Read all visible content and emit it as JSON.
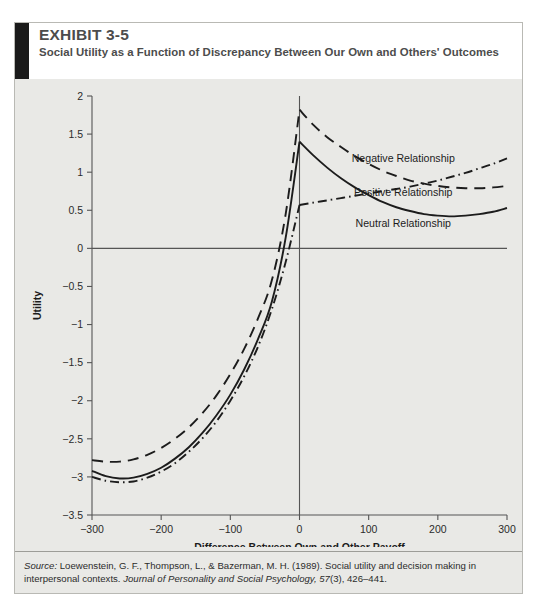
{
  "exhibit": {
    "number": "EXHIBIT 3-5",
    "title": "Social Utility as a Function of Discrepancy Between Our Own and Others' Outcomes"
  },
  "source": {
    "label": "Source:",
    "text_part1": " Loewenstein, G. F., Thompson, L., & Bazerman, M. H. (1989). Social utility and decision making in interpersonal contexts. ",
    "journal": "Journal of Personality and Social Psychology, 57",
    "text_part2": "(3), 426–441."
  },
  "chart_data": {
    "type": "line",
    "title": "Social Utility as a Function of Discrepancy Between Our Own and Others' Outcomes",
    "xlabel": "Difference Between Own and Other Payoff",
    "ylabel": "Utility",
    "xlim": [
      -300,
      300
    ],
    "ylim": [
      -3.5,
      2
    ],
    "xticks": [
      -300,
      -200,
      -100,
      0,
      100,
      200,
      300
    ],
    "xticklabels": [
      "−300",
      "−200",
      "−100",
      "0",
      "100",
      "200",
      "300"
    ],
    "yticks": [
      2,
      1.5,
      1,
      0.5,
      0,
      -0.5,
      -1,
      -1.5,
      -2,
      -2.5,
      -3,
      -3.5
    ],
    "yticklabels": [
      "2",
      "1.5",
      "1",
      "0.5",
      "0",
      "−0.5",
      "−1",
      "−1.5",
      "−2",
      "−2.5",
      "−3",
      "−3.5"
    ],
    "grid": false,
    "zero_line": true,
    "legend_position": "inline-right",
    "series": [
      {
        "name": "Negative Relationship",
        "style": "dashed",
        "label_x": 150,
        "label_y": 1.18,
        "x": [
          -300,
          -280,
          -260,
          -240,
          -220,
          -200,
          -180,
          -160,
          -140,
          -120,
          -100,
          -80,
          -60,
          -40,
          -20,
          0,
          20,
          40,
          60,
          80,
          100,
          120,
          140,
          160,
          180,
          200,
          220,
          240,
          260,
          280,
          300
        ],
        "y": [
          -2.78,
          -2.8,
          -2.8,
          -2.77,
          -2.71,
          -2.62,
          -2.5,
          -2.35,
          -2.16,
          -1.93,
          -1.65,
          -1.32,
          -0.92,
          -0.42,
          0.45,
          1.82,
          1.62,
          1.46,
          1.33,
          1.21,
          1.11,
          1.02,
          0.95,
          0.89,
          0.85,
          0.82,
          0.8,
          0.79,
          0.79,
          0.8,
          0.82
        ]
      },
      {
        "name": "Neutral Relationship",
        "style": "solid",
        "label_x": 150,
        "label_y": 0.33,
        "x": [
          -300,
          -280,
          -260,
          -240,
          -220,
          -200,
          -180,
          -160,
          -140,
          -120,
          -100,
          -80,
          -60,
          -40,
          -20,
          0,
          20,
          40,
          60,
          80,
          100,
          120,
          140,
          160,
          180,
          200,
          220,
          240,
          260,
          280,
          300
        ],
        "y": [
          -2.92,
          -2.99,
          -3.02,
          -3.01,
          -2.96,
          -2.88,
          -2.76,
          -2.61,
          -2.42,
          -2.19,
          -1.92,
          -1.59,
          -1.19,
          -0.7,
          0.14,
          1.4,
          1.22,
          1.06,
          0.92,
          0.8,
          0.7,
          0.61,
          0.54,
          0.49,
          0.45,
          0.43,
          0.42,
          0.43,
          0.45,
          0.48,
          0.53
        ]
      },
      {
        "name": "Positive Relationship",
        "style": "dashdot",
        "label_x": 150,
        "label_y": 0.74,
        "x": [
          -300,
          -280,
          -260,
          -240,
          -220,
          -200,
          -180,
          -160,
          -140,
          -120,
          -100,
          -80,
          -60,
          -40,
          -20,
          0,
          20,
          40,
          60,
          80,
          100,
          120,
          140,
          160,
          180,
          200,
          220,
          240,
          260,
          280,
          300
        ],
        "y": [
          -3.0,
          -3.05,
          -3.07,
          -3.06,
          -3.01,
          -2.93,
          -2.82,
          -2.67,
          -2.49,
          -2.27,
          -2.0,
          -1.68,
          -1.29,
          -0.8,
          -0.18,
          0.57,
          0.6,
          0.63,
          0.66,
          0.69,
          0.72,
          0.75,
          0.78,
          0.81,
          0.85,
          0.89,
          0.94,
          0.99,
          1.05,
          1.11,
          1.18
        ]
      }
    ]
  }
}
